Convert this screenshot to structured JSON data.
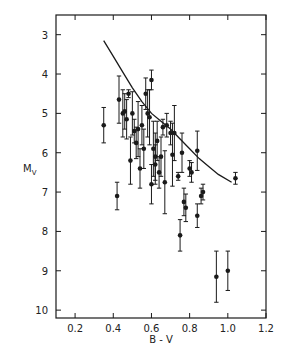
{
  "chart_data": {
    "type": "scatter",
    "title": "",
    "xlabel": "B - V",
    "ylabel": "M_V",
    "ylabel_main": "M",
    "ylabel_sub": "V",
    "xlim": [
      0.1,
      1.2
    ],
    "ylim": [
      10.2,
      2.5
    ],
    "y_inverted": true,
    "grid": false,
    "legend": null,
    "x_ticks": [
      0.2,
      0.4,
      0.6,
      0.8,
      1.0,
      1.2
    ],
    "x_tick_labels": [
      "0.2",
      "0.4",
      "0.6",
      "0.8",
      "1.0",
      "1.2"
    ],
    "y_ticks": [
      3,
      4,
      5,
      6,
      7,
      8,
      9,
      10
    ],
    "y_tick_labels": [
      "3",
      "4",
      "5",
      "6",
      "7",
      "8",
      "9",
      "10"
    ],
    "series": [
      {
        "name": "stars",
        "marker": "filled-circle-with-error-bars",
        "points": [
          {
            "x": 0.35,
            "y": 5.3,
            "err": 0.45
          },
          {
            "x": 0.42,
            "y": 7.1,
            "err": 0.35
          },
          {
            "x": 0.43,
            "y": 4.65,
            "err": 0.6
          },
          {
            "x": 0.45,
            "y": 5.0,
            "err": 0.6
          },
          {
            "x": 0.46,
            "y": 4.95,
            "err": 0.45
          },
          {
            "x": 0.47,
            "y": 5.15,
            "err": 0.5
          },
          {
            "x": 0.48,
            "y": 4.5,
            "err": 0.1
          },
          {
            "x": 0.49,
            "y": 6.2,
            "err": 0.6
          },
          {
            "x": 0.5,
            "y": 5.0,
            "err": 0.55
          },
          {
            "x": 0.51,
            "y": 5.45,
            "err": 0.3
          },
          {
            "x": 0.52,
            "y": 5.75,
            "err": 0.4
          },
          {
            "x": 0.53,
            "y": 5.4,
            "err": 0.7
          },
          {
            "x": 0.54,
            "y": 6.4,
            "err": 0.5
          },
          {
            "x": 0.55,
            "y": 5.3,
            "err": 0.5
          },
          {
            "x": 0.56,
            "y": 5.9,
            "err": 0.5
          },
          {
            "x": 0.57,
            "y": 4.5,
            "err": 0.4
          },
          {
            "x": 0.58,
            "y": 5.0,
            "err": 0.6
          },
          {
            "x": 0.59,
            "y": 5.1,
            "err": 0.7
          },
          {
            "x": 0.6,
            "y": 6.8,
            "err": 0.5
          },
          {
            "x": 0.6,
            "y": 4.15,
            "err": 0.25
          },
          {
            "x": 0.61,
            "y": 5.9,
            "err": 0.7
          },
          {
            "x": 0.62,
            "y": 6.1,
            "err": 0.6
          },
          {
            "x": 0.62,
            "y": 6.3,
            "err": 0.5
          },
          {
            "x": 0.63,
            "y": 5.7,
            "err": 0.5
          },
          {
            "x": 0.64,
            "y": 6.5,
            "err": 0.4
          },
          {
            "x": 0.65,
            "y": 6.1,
            "err": 0.5
          },
          {
            "x": 0.66,
            "y": 5.35,
            "err": 0.2
          },
          {
            "x": 0.67,
            "y": 6.75,
            "err": 0.8
          },
          {
            "x": 0.68,
            "y": 5.3,
            "err": 0.3
          },
          {
            "x": 0.7,
            "y": 5.5,
            "err": 0.3
          },
          {
            "x": 0.71,
            "y": 6.05,
            "err": 0.8
          },
          {
            "x": 0.72,
            "y": 5.5,
            "err": 0.7
          },
          {
            "x": 0.74,
            "y": 6.6,
            "err": 0.1
          },
          {
            "x": 0.75,
            "y": 8.1,
            "err": 0.4
          },
          {
            "x": 0.76,
            "y": 6.0,
            "err": 0.5
          },
          {
            "x": 0.77,
            "y": 7.25,
            "err": 0.35
          },
          {
            "x": 0.78,
            "y": 7.4,
            "err": 0.35
          },
          {
            "x": 0.8,
            "y": 6.4,
            "err": 0.2
          },
          {
            "x": 0.81,
            "y": 6.5,
            "err": 0.25
          },
          {
            "x": 0.84,
            "y": 5.95,
            "err": 0.5
          },
          {
            "x": 0.84,
            "y": 7.6,
            "err": 0.3
          },
          {
            "x": 0.86,
            "y": 7.1,
            "err": 0.2
          },
          {
            "x": 0.87,
            "y": 7.0,
            "err": 0.2
          },
          {
            "x": 0.94,
            "y": 9.15,
            "err": 0.65
          },
          {
            "x": 1.0,
            "y": 9.0,
            "err": 0.5
          },
          {
            "x": 1.04,
            "y": 6.65,
            "err": 0.15
          }
        ]
      },
      {
        "name": "main sequence curve",
        "type": "line",
        "points": [
          {
            "x": 0.35,
            "y": 3.15
          },
          {
            "x": 0.4,
            "y": 3.55
          },
          {
            "x": 0.45,
            "y": 3.95
          },
          {
            "x": 0.5,
            "y": 4.35
          },
          {
            "x": 0.55,
            "y": 4.7
          },
          {
            "x": 0.6,
            "y": 5.0
          },
          {
            "x": 0.65,
            "y": 5.2
          },
          {
            "x": 0.7,
            "y": 5.4
          },
          {
            "x": 0.75,
            "y": 5.65
          },
          {
            "x": 0.8,
            "y": 5.9
          },
          {
            "x": 0.85,
            "y": 6.15
          },
          {
            "x": 0.9,
            "y": 6.35
          },
          {
            "x": 0.95,
            "y": 6.55
          },
          {
            "x": 1.02,
            "y": 6.75
          }
        ]
      }
    ]
  },
  "plot": {
    "frame": {
      "left": 56,
      "top": 15,
      "right": 266,
      "bottom": 318
    },
    "ink_color": "#1a1a1a"
  }
}
